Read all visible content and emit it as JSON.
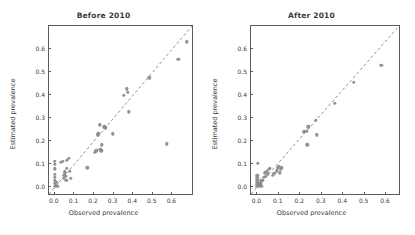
{
  "chart_data": [
    {
      "type": "scatter",
      "title": "Before 2010",
      "xlabel": "Observed prevalence",
      "ylabel": "Estimated prevalence",
      "xlim": [
        -0.03,
        0.7
      ],
      "ylim": [
        -0.03,
        0.7
      ],
      "xticks": [
        0.0,
        0.1,
        0.2,
        0.3,
        0.4,
        0.5,
        0.6
      ],
      "xticklabels": [
        "0.0",
        "0.1",
        "0.2",
        "0.3",
        "0.4",
        "0.5",
        "0.6"
      ],
      "yticks": [
        0.0,
        0.1,
        0.2,
        0.3,
        0.4,
        0.5,
        0.6
      ],
      "yticklabels": [
        "0.0",
        "0.1",
        "0.2",
        "0.3",
        "0.4",
        "0.5",
        "0.6"
      ],
      "grid": false,
      "legend": "none",
      "reference_line": {
        "style": "dashed",
        "slope": 1,
        "intercept": 0,
        "label": "identity line"
      },
      "marker_color": "#8a8a8a",
      "points": [
        [
          0.0,
          0.005
        ],
        [
          0.0,
          0.018
        ],
        [
          0.0,
          0.03
        ],
        [
          0.0,
          0.042
        ],
        [
          0.0,
          0.055
        ],
        [
          0.0,
          0.08
        ],
        [
          0.0,
          0.1
        ],
        [
          0.0,
          0.112
        ],
        [
          0.005,
          0.008
        ],
        [
          0.008,
          0.022
        ],
        [
          0.012,
          0.004
        ],
        [
          0.03,
          0.108
        ],
        [
          0.04,
          0.112
        ],
        [
          0.045,
          0.04
        ],
        [
          0.048,
          0.052
        ],
        [
          0.05,
          0.062
        ],
        [
          0.052,
          0.07
        ],
        [
          0.055,
          0.048
        ],
        [
          0.058,
          0.03
        ],
        [
          0.06,
          0.082
        ],
        [
          0.062,
          0.118
        ],
        [
          0.07,
          0.125
        ],
        [
          0.075,
          0.07
        ],
        [
          0.082,
          0.04
        ],
        [
          0.165,
          0.085
        ],
        [
          0.205,
          0.152
        ],
        [
          0.212,
          0.158
        ],
        [
          0.218,
          0.228
        ],
        [
          0.222,
          0.232
        ],
        [
          0.228,
          0.272
        ],
        [
          0.232,
          0.165
        ],
        [
          0.238,
          0.158
        ],
        [
          0.24,
          0.185
        ],
        [
          0.252,
          0.262
        ],
        [
          0.258,
          0.258
        ],
        [
          0.295,
          0.232
        ],
        [
          0.352,
          0.4
        ],
        [
          0.368,
          0.428
        ],
        [
          0.372,
          0.412
        ],
        [
          0.378,
          0.328
        ],
        [
          0.482,
          0.475
        ],
        [
          0.572,
          0.188
        ],
        [
          0.63,
          0.555
        ],
        [
          0.672,
          0.632
        ]
      ]
    },
    {
      "type": "scatter",
      "title": "After 2010",
      "xlabel": "Observed prevalence",
      "ylabel": "Estimated prevalence",
      "xlim": [
        -0.03,
        0.66
      ],
      "ylim": [
        -0.03,
        0.7
      ],
      "xticks": [
        0.0,
        0.1,
        0.2,
        0.3,
        0.4,
        0.5,
        0.6
      ],
      "xticklabels": [
        "0.0",
        "0.1",
        "0.2",
        "0.3",
        "0.4",
        "0.5",
        "0.6"
      ],
      "yticks": [
        0.0,
        0.1,
        0.2,
        0.3,
        0.4,
        0.5,
        0.6
      ],
      "yticklabels": [
        "0.0",
        "0.1",
        "0.2",
        "0.3",
        "0.4",
        "0.5",
        "0.6"
      ],
      "grid": false,
      "legend": "none",
      "reference_line": {
        "style": "dashed",
        "slope": 1,
        "intercept": 0,
        "label": "identity line"
      },
      "marker_color": "#8a8a8a",
      "points": [
        [
          0.0,
          0.004
        ],
        [
          0.0,
          0.012
        ],
        [
          0.0,
          0.022
        ],
        [
          0.0,
          0.032
        ],
        [
          0.0,
          0.042
        ],
        [
          0.0,
          0.052
        ],
        [
          0.002,
          0.105
        ],
        [
          0.006,
          0.008
        ],
        [
          0.01,
          0.006
        ],
        [
          0.012,
          0.018
        ],
        [
          0.016,
          0.014
        ],
        [
          0.018,
          0.028
        ],
        [
          0.02,
          0.004
        ],
        [
          0.026,
          0.03
        ],
        [
          0.03,
          0.042
        ],
        [
          0.034,
          0.062
        ],
        [
          0.04,
          0.048
        ],
        [
          0.044,
          0.07
        ],
        [
          0.048,
          0.058
        ],
        [
          0.052,
          0.078
        ],
        [
          0.058,
          0.082
        ],
        [
          0.072,
          0.052
        ],
        [
          0.078,
          0.06
        ],
        [
          0.09,
          0.072
        ],
        [
          0.095,
          0.085
        ],
        [
          0.1,
          0.09
        ],
        [
          0.104,
          0.062
        ],
        [
          0.108,
          0.078
        ],
        [
          0.112,
          0.085
        ],
        [
          0.215,
          0.24
        ],
        [
          0.228,
          0.242
        ],
        [
          0.232,
          0.185
        ],
        [
          0.238,
          0.262
        ],
        [
          0.272,
          0.29
        ],
        [
          0.278,
          0.228
        ],
        [
          0.362,
          0.365
        ],
        [
          0.448,
          0.455
        ],
        [
          0.578,
          0.53
        ]
      ]
    }
  ]
}
